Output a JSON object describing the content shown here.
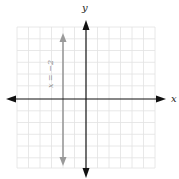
{
  "diagram": {
    "type": "coordinate-plane",
    "axes": {
      "x_label": "x",
      "y_label": "y",
      "x_range": [
        -6,
        6
      ],
      "y_range": [
        -6,
        6
      ],
      "grid": true
    },
    "lines": [
      {
        "equation": "x = −2",
        "kind": "vertical",
        "x_value": -2,
        "color": "#9a9a9a"
      }
    ],
    "colors": {
      "grid": "#e2e2e2",
      "axis": "#111111",
      "line": "#9a9a9a",
      "label": "#8a8a8a"
    }
  }
}
